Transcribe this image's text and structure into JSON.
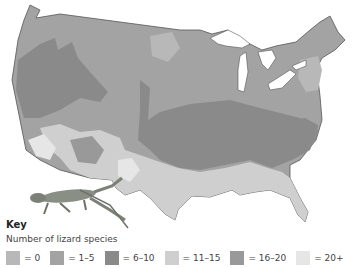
{
  "map": {
    "subject": "Number of lizard species across the contiguous United States",
    "illustration": "lizard"
  },
  "key": {
    "title": "Key",
    "subtitle": "Number of lizard species",
    "items": [
      {
        "label": "= 0",
        "color": "#b8b8b8"
      },
      {
        "label": "= 1–5",
        "color": "#a3a3a3"
      },
      {
        "label": "= 6–10",
        "color": "#8a8a8a"
      },
      {
        "label": "= 11–15",
        "color": "#cfcfcf"
      },
      {
        "label": "= 16–20",
        "color": "#999999"
      },
      {
        "label": "= 20+",
        "color": "#e6e6e6"
      }
    ]
  }
}
